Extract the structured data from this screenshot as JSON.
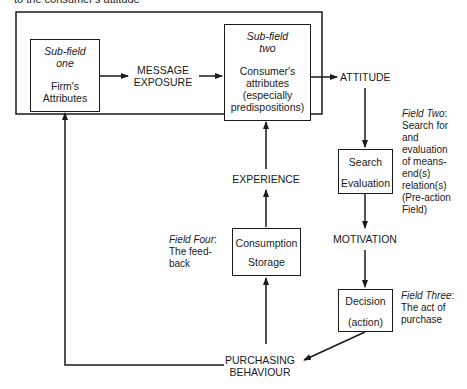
{
  "caption_fragment": "to the consumer's attitude",
  "subfield_one": {
    "heading_line1": "Sub-field",
    "heading_line2": "one",
    "body_line1": "Firm's",
    "body_line2": "Attributes"
  },
  "subfield_two": {
    "heading_line1": "Sub-field",
    "heading_line2": "two",
    "body_line1": "Consumer's",
    "body_line2": "attributes",
    "body_line3": "(especially",
    "body_line4": "predispositions)"
  },
  "labels": {
    "message_exposure_1": "MESSAGE",
    "message_exposure_2": "EXPOSURE",
    "attitude": "ATTITUDE",
    "experience": "EXPERIENCE",
    "motivation": "MOTIVATION",
    "purchasing_1": "PURCHASING",
    "purchasing_2": "BEHAVIOUR"
  },
  "search_box": {
    "line1": "Search",
    "line2": "Evaluation"
  },
  "decision_box": {
    "line1": "Decision",
    "line2": "(action)"
  },
  "consumption_box": {
    "line1": "Consumption",
    "line2": "Storage"
  },
  "field_two": {
    "title": "Field Two",
    "lines": [
      "Search for",
      "and",
      "evaluation",
      "of means-",
      "end(s)",
      "relation(s)",
      "(Pre-action",
      "Field)"
    ]
  },
  "field_three": {
    "title": "Field Three",
    "lines": [
      "The act of",
      "purchase"
    ]
  },
  "field_four": {
    "title": "Field Four",
    "lines": [
      "The feed-",
      "back"
    ]
  }
}
